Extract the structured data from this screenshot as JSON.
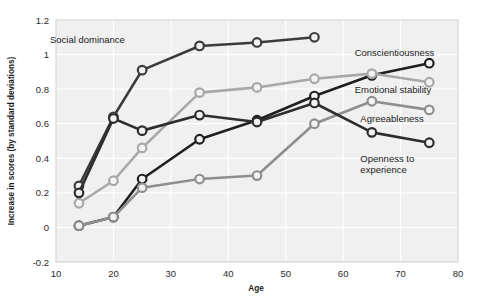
{
  "chart_data": {
    "type": "line",
    "title": "",
    "xlabel": "Age",
    "ylabel": "Increase in scores (by standard deviations)",
    "xlim": [
      10,
      80
    ],
    "ylim": [
      -0.2,
      1.2
    ],
    "xticks": [
      10,
      20,
      30,
      40,
      50,
      60,
      70,
      80
    ],
    "xtick_labels": [
      "10",
      "20",
      "30",
      "40",
      "50",
      "60",
      "70",
      "80"
    ],
    "yticks": [
      -0.2,
      0,
      0.2,
      0.4,
      0.6,
      0.8,
      1.0,
      1.2
    ],
    "ytick_labels": [
      "-0.2",
      "0",
      "0.2",
      "0.4",
      "0.6",
      "0.8",
      "1",
      "1.2"
    ],
    "grid": true,
    "grid_color": "#ffffff",
    "plot_background": "#f0f0f0",
    "legend_position": "inline-annotations",
    "marker": "open-circle",
    "series": [
      {
        "name": "Social dominance",
        "color": "#3b3b3b",
        "label_x": 22,
        "label_y": 1.09,
        "x": [
          14,
          20,
          25,
          35,
          45,
          55
        ],
        "y": [
          0.24,
          0.64,
          0.91,
          1.05,
          1.07,
          1.1
        ]
      },
      {
        "name": "Conscientiousness",
        "color": "#1f1f1f",
        "label_x": 62,
        "label_y": 1.01,
        "x": [
          14,
          20,
          25,
          35,
          45,
          55,
          65,
          75
        ],
        "y": [
          0.01,
          0.06,
          0.28,
          0.51,
          0.62,
          0.76,
          0.88,
          0.95
        ]
      },
      {
        "name": "Emotional stability",
        "color": "#a8a8a8",
        "label_x": 62,
        "label_y": 0.8,
        "x": [
          14,
          20,
          25,
          35,
          45,
          55,
          65,
          75
        ],
        "y": [
          0.14,
          0.27,
          0.46,
          0.78,
          0.81,
          0.86,
          0.89,
          0.84
        ]
      },
      {
        "name": "Agreeableness",
        "color": "#8e8e8e",
        "label_x": 63,
        "label_y": 0.63,
        "x": [
          14,
          20,
          25,
          35,
          45,
          55,
          65,
          75
        ],
        "y": [
          0.01,
          0.06,
          0.23,
          0.28,
          0.3,
          0.6,
          0.73,
          0.68
        ]
      },
      {
        "name": "Openness to experience",
        "color": "#2e2e2e",
        "label_x": 63,
        "label_y": 0.4,
        "x": [
          14,
          20,
          25,
          35,
          45,
          55,
          65,
          75
        ],
        "y": [
          0.2,
          0.63,
          0.56,
          0.65,
          0.61,
          0.72,
          0.55,
          0.49
        ]
      }
    ],
    "annotations": [
      {
        "text": "Social dominance",
        "anchor": "end"
      },
      {
        "text": "Conscientiousness",
        "anchor": "start"
      },
      {
        "text": "Emotional stability",
        "anchor": "start"
      },
      {
        "text": "Agreeableness",
        "anchor": "start"
      },
      {
        "text": "Openness to",
        "anchor": "start"
      },
      {
        "text": "experience",
        "anchor": "start"
      }
    ]
  }
}
